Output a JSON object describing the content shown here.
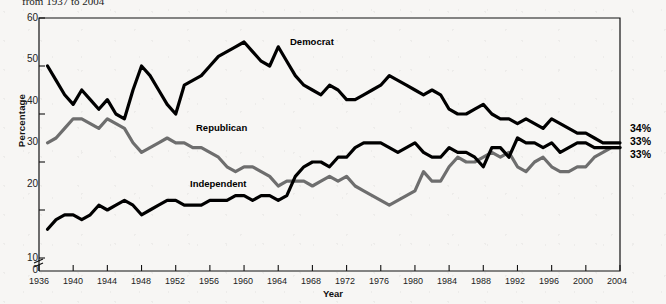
{
  "caption": "from 1937 to 2004",
  "axes": {
    "ylabel": "Percentage",
    "xlabel": "Year",
    "yticks": [
      "0",
      "10",
      "20",
      "30",
      "40",
      "50",
      "60"
    ],
    "xticks": [
      "1936",
      "1940",
      "1944",
      "1948",
      "1952",
      "1956",
      "1960",
      "1964",
      "1968",
      "1972",
      "1976",
      "1980",
      "1984",
      "1988",
      "1992",
      "1996",
      "2000",
      "2004"
    ]
  },
  "series_labels": {
    "democrat": "Democrat",
    "republican": "Republican",
    "independent": "Independent"
  },
  "end_labels": {
    "democrat": "34%",
    "republican": "33%",
    "independent": "33%"
  },
  "colors": {
    "democrat": "#000000",
    "republican": "#6e6e6e",
    "independent": "#000000",
    "frame": "#111111",
    "background": "#f7f6f4"
  },
  "chart_data": {
    "type": "line",
    "title": "from 1937 to 2004",
    "xlabel": "Year",
    "ylabel": "Percentage",
    "xlim": [
      1936,
      2004
    ],
    "ylim": [
      0,
      60
    ],
    "yticks": [
      0,
      10,
      20,
      30,
      40,
      50,
      60
    ],
    "xticks": [
      1936,
      1940,
      1944,
      1948,
      1952,
      1956,
      1960,
      1964,
      1968,
      1972,
      1976,
      1980,
      1984,
      1988,
      1992,
      1996,
      2000,
      2004
    ],
    "axis_break": true,
    "grid": false,
    "legend": "inline-labels",
    "x": [
      1937,
      1938,
      1939,
      1940,
      1941,
      1942,
      1943,
      1944,
      1945,
      1946,
      1947,
      1948,
      1949,
      1950,
      1951,
      1952,
      1953,
      1954,
      1955,
      1956,
      1957,
      1958,
      1959,
      1960,
      1961,
      1962,
      1963,
      1964,
      1965,
      1966,
      1967,
      1968,
      1969,
      1970,
      1971,
      1972,
      1973,
      1974,
      1975,
      1976,
      1977,
      1978,
      1979,
      1980,
      1981,
      1982,
      1983,
      1984,
      1985,
      1986,
      1987,
      1988,
      1989,
      1990,
      1991,
      1992,
      1993,
      1994,
      1995,
      1996,
      1997,
      1998,
      1999,
      2000,
      2001,
      2002,
      2003,
      2004
    ],
    "series": [
      {
        "name": "Democrat",
        "color": "#000000",
        "end_label": "34%",
        "values": [
          50,
          47,
          44,
          42,
          45,
          43,
          41,
          43,
          40,
          39,
          45,
          50,
          48,
          45,
          42,
          40,
          46,
          47,
          48,
          50,
          52,
          53,
          54,
          55,
          53,
          51,
          50,
          54,
          51,
          48,
          46,
          45,
          44,
          46,
          45,
          43,
          43,
          44,
          45,
          46,
          48,
          47,
          46,
          45,
          44,
          45,
          44,
          41,
          40,
          40,
          41,
          42,
          40,
          39,
          39,
          38,
          39,
          38,
          37,
          39,
          38,
          37,
          36,
          36,
          35,
          34,
          34,
          34
        ]
      },
      {
        "name": "Republican",
        "color": "#6e6e6e",
        "end_label": "33%",
        "values": [
          34,
          35,
          37,
          39,
          39,
          38,
          37,
          39,
          38,
          37,
          34,
          32,
          33,
          34,
          35,
          34,
          34,
          33,
          33,
          32,
          31,
          29,
          28,
          29,
          29,
          28,
          27,
          25,
          26,
          26,
          26,
          25,
          26,
          27,
          26,
          27,
          25,
          24,
          23,
          22,
          21,
          22,
          23,
          24,
          28,
          26,
          26,
          29,
          31,
          30,
          30,
          31,
          32,
          31,
          32,
          29,
          28,
          30,
          31,
          29,
          28,
          28,
          29,
          29,
          31,
          32,
          33,
          33
        ]
      },
      {
        "name": "Independent",
        "color": "#000000",
        "end_label": "33%",
        "values": [
          16,
          18,
          19,
          19,
          18,
          19,
          21,
          20,
          21,
          22,
          21,
          19,
          20,
          21,
          22,
          22,
          21,
          21,
          21,
          22,
          22,
          22,
          23,
          23,
          22,
          23,
          23,
          22,
          23,
          27,
          29,
          30,
          30,
          29,
          31,
          31,
          33,
          34,
          34,
          34,
          33,
          32,
          33,
          34,
          32,
          31,
          31,
          33,
          32,
          32,
          31,
          29,
          33,
          33,
          31,
          35,
          34,
          34,
          33,
          34,
          32,
          33,
          34,
          34,
          33,
          33,
          33,
          33
        ]
      }
    ]
  }
}
